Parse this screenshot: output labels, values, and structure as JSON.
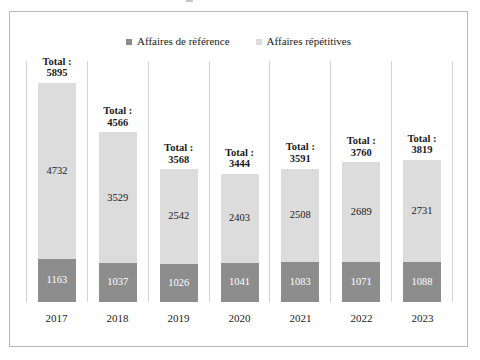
{
  "legend": {
    "position": "top-center",
    "entries": [
      {
        "label": "Affaires de référence",
        "color": "#8d8d8d",
        "icon": "square-swatch-icon"
      },
      {
        "label": "Affaires répétitives",
        "color": "#dcdcdc",
        "icon": "square-swatch-icon"
      }
    ]
  },
  "labels": {
    "total_prefix": "Total :"
  },
  "colors": {
    "reference_series": "#8d8d8d",
    "repetitive_series": "#dcdcdc",
    "frame_border": "#b9b9b9",
    "separator": "#d3d3d3",
    "text": "#1b1b1b"
  },
  "chart_data": {
    "type": "bar",
    "subtype": "stacked-vertical",
    "title": "",
    "subtitle": "",
    "xlabel": "",
    "ylabel": "",
    "grid": false,
    "axis_visible": false,
    "legend_position": "top-center",
    "ylim": [
      0,
      5895
    ],
    "categories": [
      "2017",
      "2018",
      "2019",
      "2020",
      "2021",
      "2022",
      "2023"
    ],
    "series": [
      {
        "name": "Affaires de référence",
        "color": "#8d8d8d",
        "values": [
          1163,
          1037,
          1026,
          1041,
          1083,
          1071,
          1088
        ]
      },
      {
        "name": "Affaires répétitives",
        "color": "#dcdcdc",
        "values": [
          4732,
          3529,
          2542,
          2403,
          2508,
          2689,
          2731
        ]
      }
    ],
    "totals": [
      5895,
      4566,
      3568,
      3444,
      3591,
      3760,
      3819
    ],
    "total_labels": [
      "Total :\n5895",
      "Total :\n4566",
      "Total :\n3568",
      "Total :\n3444",
      "Total :\n3591",
      "Total :\n3760",
      "Total :\n3819"
    ]
  }
}
